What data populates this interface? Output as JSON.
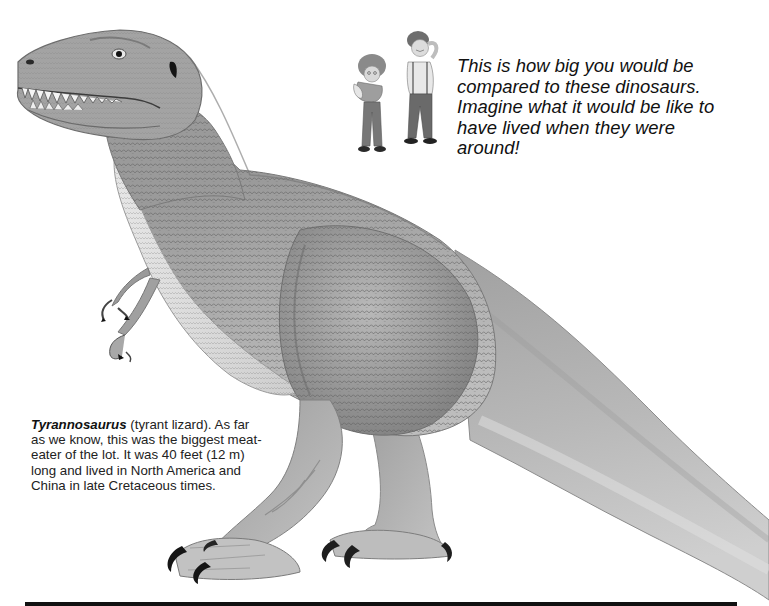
{
  "page": {
    "background": "#ffffff",
    "ink_color": "#111111"
  },
  "illustration": {
    "subject": "Tyrannosaurus",
    "style": "grayscale pencil illustration",
    "size_comparison_figures": "two children"
  },
  "compare_caption": {
    "text": "This is how big you would be compared to these dinosaurs. Imagine what it would be like to have lived when they were around!",
    "lines": [
      "This is how big you would be",
      "compared to these dinosaurs.",
      "Imagine what it would be like to",
      "have lived when they were",
      "around!"
    ]
  },
  "species_caption": {
    "name": "Tyrannosaurus",
    "rest": " (tyrant lizard). As far as we know, this was the biggest meat-eater of the lot. It was 40 feet (12 m) long and lived in North America and China in late Cretaceous times."
  },
  "icons": {
    "dinosaur": "tyrannosaurus-illustration",
    "kids": "children-figures"
  }
}
